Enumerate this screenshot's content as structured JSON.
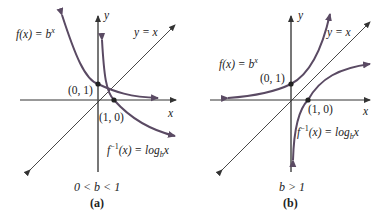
{
  "panel_a": {
    "caption": "(a)",
    "condition": "0 < b < 1",
    "f_label": "f(x) = b",
    "f_exp": "x",
    "finv_label_pre": "f",
    "finv_sup": "−1",
    "finv_label_mid": "(x) = log",
    "finv_sub": "b",
    "finv_x": "x",
    "line_label": "y = x",
    "point1": "(0, 1)",
    "point2": "(1, 0)",
    "x_axis": "x",
    "y_axis": "y"
  },
  "panel_b": {
    "caption": "(b)",
    "condition": "b > 1",
    "f_label": "f(x) = b",
    "f_exp": "x",
    "finv_label_pre": "f",
    "finv_sup": "−1",
    "finv_label_mid": "(x) = log",
    "finv_sub": "b",
    "finv_x": "x",
    "line_label": "y = x",
    "point1": "(0, 1)",
    "point2": "(1, 0)",
    "x_axis": "x",
    "y_axis": "y"
  },
  "colors": {
    "curve": "#5a4a63",
    "axis": "#333333"
  }
}
